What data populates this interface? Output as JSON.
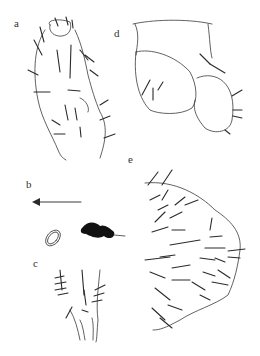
{
  "figure": {
    "panels": [
      {
        "id": "a",
        "label": "a",
        "content": "appendage with setae (line drawing)"
      },
      {
        "id": "b",
        "label": "b",
        "content": "arrow pointing left, oval egg and dark granular mass"
      },
      {
        "id": "c",
        "label": "c",
        "content": "tip structure with setae (line drawing)"
      },
      {
        "id": "d",
        "label": "d",
        "content": "lobed segment with few setae (line drawing)"
      },
      {
        "id": "e",
        "label": "e",
        "content": "plate with numerous setae (line drawing)"
      }
    ]
  }
}
